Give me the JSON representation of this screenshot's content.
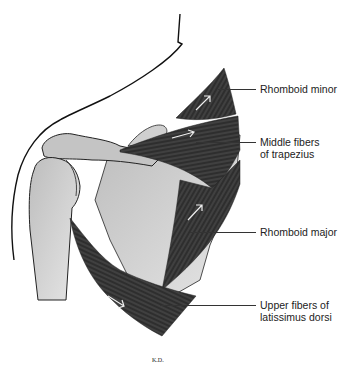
{
  "figure": {
    "type": "anatomical illustration",
    "colors": {
      "bone": "#c9c9c9",
      "muscle": "#3a3a3a",
      "outline": "#111111",
      "background": "#ffffff"
    }
  },
  "labels": [
    {
      "id": "rhomboid-minor",
      "line1": "Rhomboid minor",
      "line2": ""
    },
    {
      "id": "middle-trapezius",
      "line1": "Middle fibers",
      "line2": "of trapezius"
    },
    {
      "id": "rhomboid-major",
      "line1": "Rhomboid major",
      "line2": ""
    },
    {
      "id": "upper-latissimus",
      "line1": "Upper fibers of",
      "line2": "latissimus dorsi"
    }
  ],
  "signature": "K.D."
}
